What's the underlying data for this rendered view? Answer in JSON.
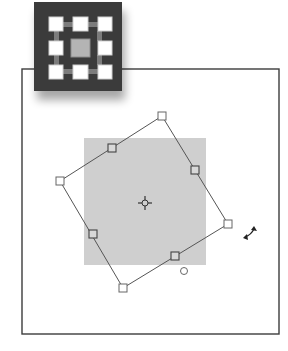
{
  "figure": {
    "tool_icon": {
      "name": "reference-point-grid-icon",
      "colors": {
        "background": "#3a3a3a",
        "handle": "#ffffff",
        "center": "#b4b4b4",
        "connector": "#8a8a8a"
      }
    },
    "canvas": {
      "frame_color": "#3c3c3c",
      "background": "#ffffff"
    },
    "original_object": {
      "fill": "#cfcfcf"
    },
    "bounding_box": {
      "stroke": "#555555",
      "handle_fill": "#ffffff",
      "rotation_degrees": -30
    },
    "cursor": {
      "name": "rotate-cursor-icon"
    }
  }
}
